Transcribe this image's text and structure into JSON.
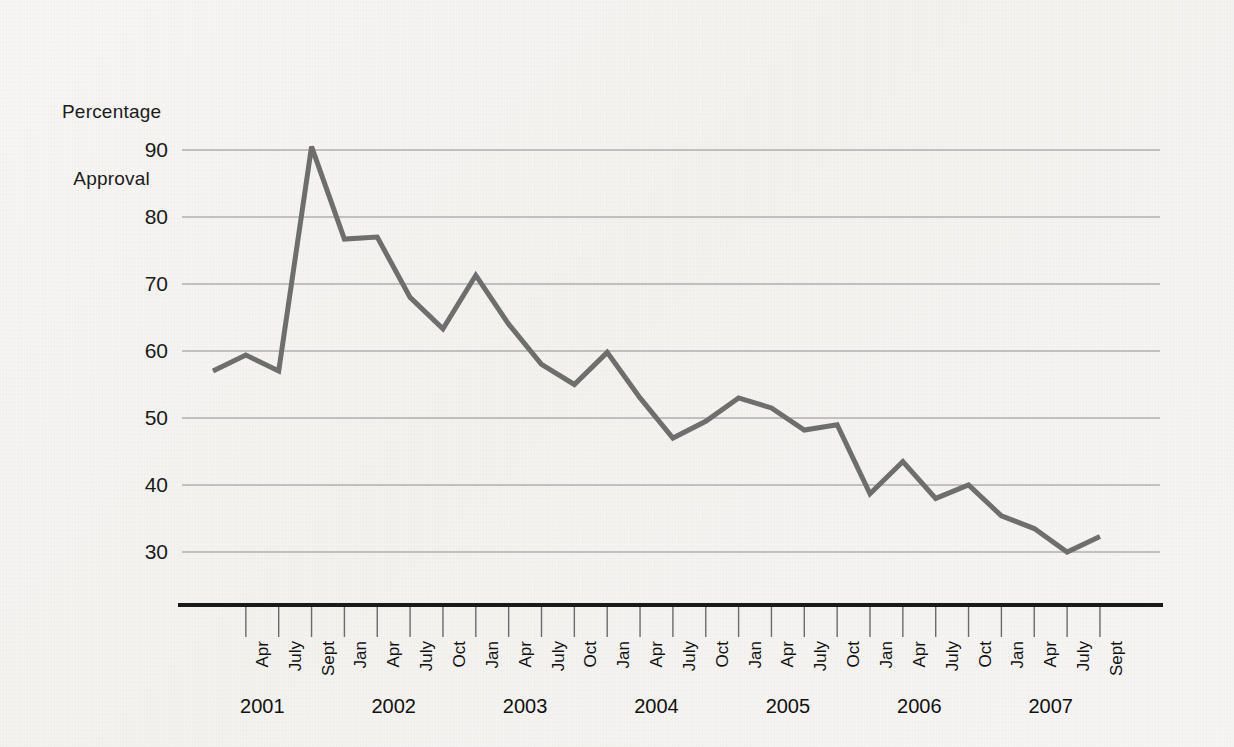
{
  "figure": {
    "background_color": "#f4f3f1",
    "line_color": "#6e6e6e",
    "grid_color": "#8d8d8d",
    "axis_color": "#1a1a1a",
    "text_color": "#1b1b1b"
  },
  "chart_data": {
    "type": "line",
    "title": "",
    "subtitle": "",
    "xlabel": "",
    "ylabel": "Percentage\nApproval",
    "ylabel_lines": [
      "Percentage",
      "Approval"
    ],
    "ylim": [
      24,
      95
    ],
    "yticks": [
      30,
      40,
      50,
      60,
      70,
      80,
      90
    ],
    "ytick_labels": [
      "30",
      "40",
      "50",
      "60",
      "70",
      "80",
      "90"
    ],
    "grid": true,
    "grid_axis": "y",
    "legend": false,
    "legend_position": "none",
    "x": [
      "Jan 2001",
      "Apr 2001",
      "July 2001",
      "Sept 2001",
      "Jan 2002",
      "Apr 2002",
      "July 2002",
      "Oct 2002",
      "Jan 2003",
      "Apr 2003",
      "July 2003",
      "Oct 2003",
      "Jan 2004",
      "Apr 2004",
      "July 2004",
      "Oct 2004",
      "Jan 2005",
      "Apr 2005",
      "July 2005",
      "Oct 2005",
      "Jan 2006",
      "Apr 2006",
      "July 2006",
      "Oct 2006",
      "Jan 2007",
      "Apr 2007",
      "July 2007",
      "Sept 2007"
    ],
    "xtick_labels": [
      "",
      "Apr",
      "July",
      "Sept",
      "Jan",
      "Apr",
      "July",
      "Oct",
      "Jan",
      "Apr",
      "July",
      "Oct",
      "Jan",
      "Apr",
      "July",
      "Oct",
      "Jan",
      "Apr",
      "July",
      "Oct",
      "Jan",
      "Apr",
      "July",
      "Oct",
      "Jan",
      "Apr",
      "July",
      "Sept"
    ],
    "values": [
      57.0,
      59.4,
      57.0,
      90.5,
      76.7,
      77.0,
      68.0,
      63.3,
      71.3,
      64.0,
      58.0,
      55.0,
      59.8,
      53.0,
      47.0,
      49.5,
      53.0,
      51.5,
      48.2,
      49.0,
      38.7,
      43.5,
      38.0,
      40.0,
      35.4,
      33.5,
      30.0,
      32.3
    ],
    "series": [
      {
        "name": "Percentage Approval",
        "color": "#6e6e6e",
        "values": [
          57.0,
          59.4,
          57.0,
          90.5,
          76.7,
          77.0,
          68.0,
          63.3,
          71.3,
          64.0,
          58.0,
          55.0,
          59.8,
          53.0,
          47.0,
          49.5,
          53.0,
          51.5,
          48.2,
          49.0,
          38.7,
          43.5,
          38.0,
          40.0,
          35.4,
          33.5,
          30.0,
          32.3
        ]
      }
    ],
    "year_groups": [
      {
        "label": "2001",
        "start_index": 0,
        "end_index": 3
      },
      {
        "label": "2002",
        "start_index": 4,
        "end_index": 7
      },
      {
        "label": "2003",
        "start_index": 8,
        "end_index": 11
      },
      {
        "label": "2004",
        "start_index": 12,
        "end_index": 15
      },
      {
        "label": "2005",
        "start_index": 16,
        "end_index": 19
      },
      {
        "label": "2006",
        "start_index": 20,
        "end_index": 23
      },
      {
        "label": "2007",
        "start_index": 24,
        "end_index": 27
      }
    ],
    "annotations": []
  }
}
